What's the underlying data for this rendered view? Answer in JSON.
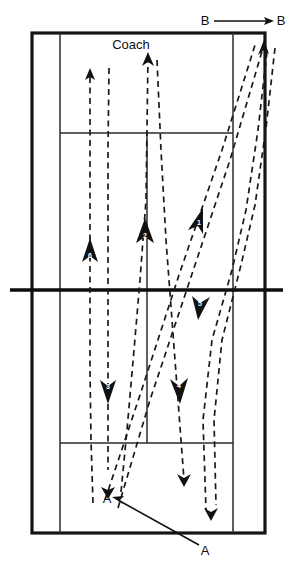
{
  "diagram": {
    "court": {
      "outer": {
        "x": 32,
        "y": 33,
        "width": 233,
        "height": 500
      },
      "left_sideline_x": 60,
      "right_sideline_x": 233,
      "net_y": 290,
      "top_service_line_y": 133,
      "bottom_service_line_y": 443,
      "top_center_line": {
        "x": 147,
        "y1": 133,
        "y2": 290
      },
      "bottom_center_line": {
        "x": 147,
        "y1": 290,
        "y2": 443
      },
      "line_color": "#141414",
      "net_color": "#0d0d0d"
    },
    "labels": [
      {
        "name": "label-coach",
        "text": "Coach",
        "x": 131,
        "y": 46
      },
      {
        "name": "label-b-left",
        "text": "B",
        "x": 205,
        "y": 22
      },
      {
        "name": "label-b-right",
        "text": "B",
        "x": 281,
        "y": 22
      },
      {
        "name": "label-a-court",
        "text": "A",
        "x": 107,
        "y": 500
      },
      {
        "name": "label-a-outside",
        "text": "A",
        "x": 205,
        "y": 552
      }
    ],
    "movement_arrows": [
      {
        "name": "player-b-movement",
        "from": {
          "x": 214,
          "y": 21
        },
        "to": {
          "x": 272,
          "y": 21
        },
        "style": "solid"
      },
      {
        "name": "player-a-movement",
        "from": {
          "x": 199,
          "y": 545
        },
        "to": {
          "x": 114,
          "y": 497
        },
        "style": "solid"
      }
    ],
    "shot_paths": [
      {
        "name": "shot-path-6",
        "number": "6",
        "direction": "up",
        "color": "#1a1a1a",
        "points": "93,503 91,440 90,370 90,300 90,230 90,72",
        "arrow_at": {
          "x": 90,
          "y": 252,
          "angle": -90
        },
        "tip_arrow": {
          "x": 90,
          "y": 72,
          "angle": -90
        }
      },
      {
        "name": "shot-path-3",
        "number": "3",
        "direction": "down",
        "color": "#1a1a1a",
        "points": "109,68 108,150 108,240 108,300 108,380 108,470",
        "arrow_at": {
          "x": 108,
          "y": 392,
          "angle": 90
        },
        "tip_arrow": {
          "x": 108,
          "y": 494,
          "angle": 90
        }
      },
      {
        "name": "shot-path-2",
        "number": "2",
        "direction": "up",
        "color": "#1a1a1a",
        "points": "121,492 127,430 134,350 140,280 146,200 148,56",
        "arrow_at": {
          "x": 145,
          "y": 232,
          "angle": -88
        },
        "tip_arrow": {
          "x": 148,
          "y": 56,
          "angle": -86
        }
      },
      {
        "name": "shot-path-4",
        "number": "4",
        "direction": "down",
        "color": "#1a1a1a",
        "points": "157,60 161,150 166,240 172,320 178,400 184,480",
        "arrow_at": {
          "x": 178,
          "y": 392,
          "angle": 86
        },
        "tip_arrow": {
          "x": 184,
          "y": 480,
          "angle": 86
        }
      },
      {
        "name": "shot-path-1",
        "number": "1",
        "direction": "up-right",
        "color": "#1a1a1a",
        "points": "118,508 150,400 190,280 230,160 263,48",
        "arrow_at": {
          "x": 200,
          "y": 220,
          "angle": -70
        },
        "tip_arrow": {
          "x": 263,
          "y": 48,
          "angle": -70
        }
      },
      {
        "name": "shot-path-1b",
        "number": "",
        "direction": "up-right",
        "color": "#1a1a1a",
        "points": "105,500 140,395 180,272 222,150 256,42",
        "arrow_at": null,
        "tip_arrow": null
      },
      {
        "name": "shot-path-5",
        "number": "5",
        "direction": "down",
        "color": "#1a1a1a",
        "points": "267,52 258,130 246,210 232,270 212,340 203,420 206,510",
        "arrow_at": {
          "x": 205,
          "y": 302,
          "angle": 105
        },
        "tip_arrow": {
          "x": 206,
          "y": 512,
          "angle": 92
        }
      },
      {
        "name": "shot-path-5b",
        "number": "",
        "direction": "down",
        "color": "#1a1a1a",
        "points": "275,48 266,128 255,205 241,265 222,340 214,420 216,505",
        "arrow_at": null,
        "tip_arrow": null
      }
    ]
  }
}
